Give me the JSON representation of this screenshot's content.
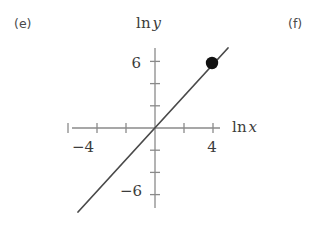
{
  "figure": {
    "part_labels": [
      {
        "name": "part-label-e",
        "text": "(e)"
      },
      {
        "name": "part-label-f",
        "text": "(f)"
      }
    ],
    "background_color": "#ffffff",
    "axis_color": "#8a8a8a",
    "line_color": "#4a4a4a",
    "point_color": "#111111",
    "text_color": "#3c3c3c"
  },
  "axis_titles": {
    "y": {
      "operator": "ln",
      "variable": "y"
    },
    "x": {
      "operator": "ln",
      "variable": "x"
    }
  },
  "tick_labels": {
    "x_neg_4": "−4",
    "x_pos_4": "4",
    "y_pos_6": "6",
    "y_neg_6": "−6"
  },
  "chart_data": {
    "type": "line",
    "title": "",
    "subtitle": "",
    "xlabel": "ln x",
    "ylabel": "ln y",
    "xlim": [
      -5.7,
      4.5
    ],
    "ylim": [
      -7.3,
      7.3
    ],
    "grid": false,
    "legend": null,
    "axes": {
      "origin_px": [
        155,
        128
      ],
      "x_axis_px": {
        "x_start": 72,
        "x_end": 220,
        "y": 128
      },
      "y_axis_px": {
        "y_start": 48,
        "y_end": 208,
        "x": 155
      },
      "x_unit_px_per_unit": 14.5,
      "y_unit_px_per_unit": 11.1,
      "x_ticks": [
        -6,
        -4,
        -2,
        2,
        4
      ],
      "x_ticks_labeled": [
        -4,
        4
      ],
      "y_ticks": [
        -6,
        -4,
        -2,
        2,
        4,
        6
      ],
      "y_ticks_labeled": [
        -6,
        6
      ],
      "tick_half_length_px": 5
    },
    "series": [
      {
        "name": "fitted straight line",
        "type": "line",
        "slope": 1.45,
        "intercept": 0.0,
        "x_range": [
          -5.3,
          5.0
        ],
        "endpoints_px": [
          [
            78,
            212
          ],
          [
            228,
            48
          ]
        ],
        "passes_through_origin": true
      },
      {
        "name": "marked data point",
        "type": "scatter",
        "x": [
          3.9
        ],
        "y": [
          5.7
        ],
        "point_px": [
          [
            212,
            63
          ]
        ],
        "marker": "filled-circle",
        "marker_radius_px": 6.2
      }
    ],
    "annotations": [
      {
        "name": "part-label-e",
        "text": "(e)",
        "position_px": [
          14,
          18
        ]
      },
      {
        "name": "part-label-f",
        "text": "(f)",
        "position_px": [
          288,
          18
        ]
      }
    ]
  }
}
